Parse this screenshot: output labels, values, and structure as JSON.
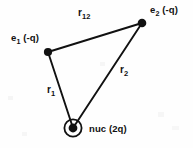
{
  "figure": {
    "background_color": "#fefefe",
    "ink_color": "#111111",
    "width": 193,
    "height": 148
  },
  "nodes": {
    "e1": {
      "label": "e",
      "subscript": "1",
      "charge": "(-q)",
      "full_label": "e1 (-q)",
      "x": 48,
      "y": 52,
      "marker": "filled-dot"
    },
    "e2": {
      "label": "e",
      "subscript": "2",
      "charge": "(-q)",
      "full_label": "e2 (-q)",
      "x": 142,
      "y": 23,
      "marker": "filled-dot"
    },
    "nucleus": {
      "label": "nuc",
      "charge": "(2q)",
      "full_label": "nuc (2q)",
      "x": 73,
      "y": 128,
      "marker": "dot-in-ring"
    }
  },
  "edges": {
    "r12": {
      "label": "r",
      "subscript": "12",
      "full_label": "r12",
      "from": "e1",
      "to": "e2"
    },
    "r1": {
      "label": "r",
      "subscript": "1",
      "full_label": "r1",
      "from": "e1",
      "to": "nucleus"
    },
    "r2": {
      "label": "r",
      "subscript": "2",
      "full_label": "r2",
      "from": "e2",
      "to": "nucleus"
    }
  }
}
